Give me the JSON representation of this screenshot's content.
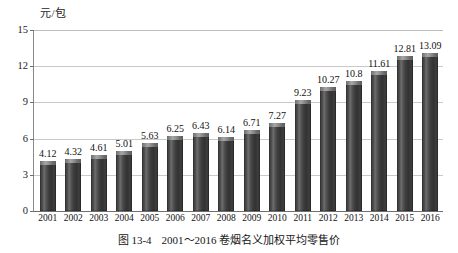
{
  "chart_data": {
    "type": "bar",
    "title": "",
    "unit_label": "元/包",
    "xlabel": "",
    "ylabel": "元/包",
    "ylim": [
      0,
      15
    ],
    "yticks": [
      0,
      3,
      6,
      9,
      12,
      15
    ],
    "grid": true,
    "legend": null,
    "categories": [
      "2001",
      "2002",
      "2003",
      "2004",
      "2005",
      "2006",
      "2007",
      "2008",
      "2009",
      "2010",
      "2011",
      "2012",
      "2013",
      "2014",
      "2015",
      "2016"
    ],
    "values": [
      4.12,
      4.32,
      4.61,
      5.01,
      5.63,
      6.25,
      6.43,
      6.14,
      6.71,
      7.27,
      9.23,
      10.27,
      10.8,
      11.61,
      12.81,
      13.09
    ],
    "data_labels": [
      "4.12",
      "4.32",
      "4.61",
      "5.01",
      "5.63",
      "6.25",
      "6.43",
      "6.14",
      "6.71",
      "7.27",
      "9.23",
      "10.27",
      "10.8",
      "11.61",
      "12.81",
      "13.09"
    ],
    "bar_color": "#3d3d3d",
    "bar_highlight_color": "#6e6e6e",
    "gridline_color": "#c9c9c9",
    "axis_color": "#6f6f6f"
  },
  "caption": {
    "figure_number": "图 13-4",
    "text": "2001～2016 卷烟名义加权平均零售价"
  }
}
